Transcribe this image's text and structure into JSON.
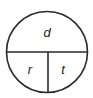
{
  "diagram": {
    "type": "formula-triangle-circle",
    "top_label": "d",
    "bottom_left_label": "r",
    "bottom_right_label": "t",
    "stroke_color": "#2a2a2a",
    "background_color": "#ffffff"
  }
}
